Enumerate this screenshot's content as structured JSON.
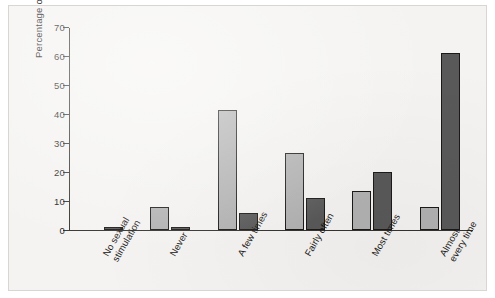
{
  "chart_data": {
    "type": "bar",
    "title": "",
    "subtitle": "",
    "xlabel": "",
    "ylabel": "Percentage of patients",
    "ylim": [
      0,
      70
    ],
    "yticks": [
      0,
      10,
      20,
      30,
      40,
      50,
      60,
      70
    ],
    "grid": false,
    "legend": "none",
    "orientation": "vertical",
    "grouping": "grouped",
    "categories": [
      "No sexual\nstimulation",
      "Never",
      "A few times",
      "Fairly often",
      "Most times",
      "Almost\nevery time"
    ],
    "series": [
      {
        "name": "series-light",
        "color": "#b2b2b2",
        "values": [
          0,
          8,
          41.5,
          26.5,
          13.5,
          8
        ]
      },
      {
        "name": "series-dark",
        "color": "#595959",
        "values": [
          1,
          1,
          6,
          11,
          20,
          61
        ]
      }
    ]
  },
  "figure": {
    "background": "#f4f3f1",
    "border_color": "#d8d6d3",
    "axis_color": "#35322f",
    "bar_edge_color": "#1b1a19"
  }
}
